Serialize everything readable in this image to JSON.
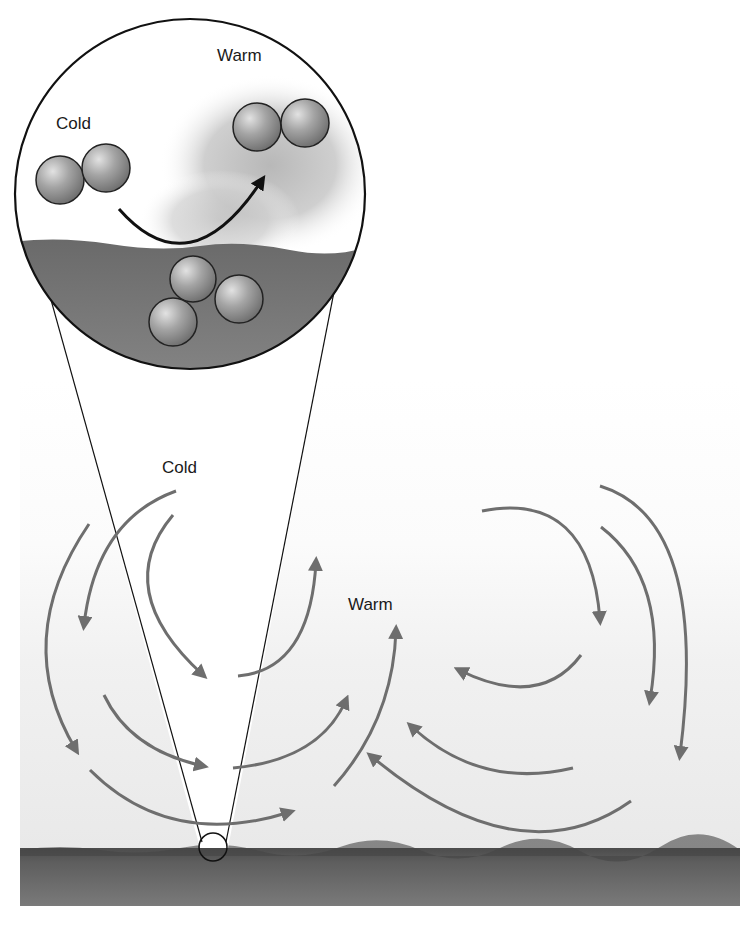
{
  "diagram": {
    "type": "illustration",
    "inset": {
      "labels": {
        "cold": "Cold",
        "warm": "Warm"
      },
      "molecules": {
        "cold_pair": 2,
        "warm_pair": 2,
        "surface_cluster": 3
      }
    },
    "main": {
      "labels": {
        "cold": "Cold",
        "warm": "Warm"
      },
      "left_cell_direction": "counterclockwise",
      "right_cell_direction": "clockwise"
    },
    "colors": {
      "arrow": "#6e6e6e",
      "inset_arrow": "#111111",
      "ground": "#6a6a6a",
      "sky_top": "#ffffff",
      "sky_bottom": "#ececec",
      "molecule": "#9a9a9a",
      "liquid": "#767676"
    }
  }
}
